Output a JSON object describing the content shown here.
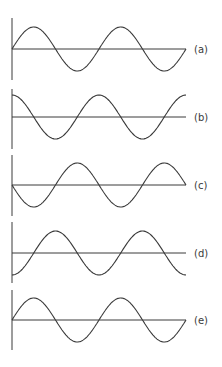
{
  "figure": {
    "stroke_color": "#3a3a3a",
    "background": "#ffffff",
    "panels": [
      {
        "id": "a",
        "label": "(a)",
        "waveform": "sine",
        "phase_deg": 0
      },
      {
        "id": "b",
        "label": "(b)",
        "waveform": "cosine",
        "phase_deg": 90
      },
      {
        "id": "c",
        "label": "(c)",
        "waveform": "negative sine",
        "phase_deg": 180
      },
      {
        "id": "d",
        "label": "(d)",
        "waveform": "negative cosine",
        "phase_deg": 270
      },
      {
        "id": "e",
        "label": "(e)",
        "waveform": "sine",
        "phase_deg": 0
      }
    ],
    "cycles_shown": 2
  }
}
